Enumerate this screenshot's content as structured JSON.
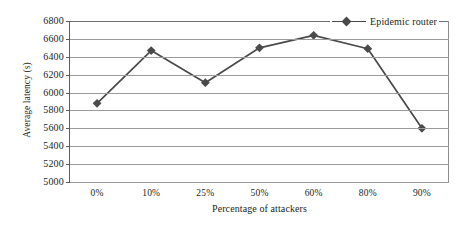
{
  "chart_data": {
    "type": "line",
    "title": "",
    "xlabel": "Percentage of attackers",
    "ylabel": "Average latency (s)",
    "categories": [
      "0%",
      "10%",
      "25%",
      "50%",
      "60%",
      "80%",
      "90%"
    ],
    "series": [
      {
        "name": "Epidemic router",
        "values": [
          5880,
          6470,
          6110,
          6500,
          6640,
          6490,
          5600
        ],
        "color": "#4a4a4a",
        "marker": "diamond"
      }
    ],
    "ylim": [
      5000,
      6800
    ],
    "ytick_step": 200,
    "yticks": [
      "5000",
      "5200",
      "5400",
      "5600",
      "5800",
      "6000",
      "6200",
      "6400",
      "6600",
      "6800"
    ],
    "grid": "horizontal",
    "legend_position": "top-right",
    "legend_entries": [
      "Epidemic router"
    ]
  },
  "axes": {
    "y_title": "Average latency (s)",
    "x_title": "Percentage of attackers"
  },
  "legend": {
    "series_label": "Epidemic router"
  }
}
